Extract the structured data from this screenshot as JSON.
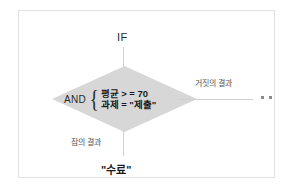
{
  "diagram": {
    "type": "if-condition-flowchart",
    "top_label": "IF",
    "decision": {
      "operator": "AND",
      "brace": "{",
      "conditions": [
        "평균 > = 70",
        "과제 = \"제출\""
      ]
    },
    "branches": {
      "false_label": "거짓의 결과",
      "true_label": "참의 결과"
    },
    "true_result": "\"수료\"",
    "false_terminal_dots": [
      "dot",
      "dot"
    ]
  },
  "colors": {
    "diamond_fill": "#d7d7d7",
    "connector_line": "#d0d0d0",
    "frame_border": "#e2e2e2",
    "text_primary": "#1a1a1a",
    "text_secondary": "#555555",
    "background": "#ffffff"
  }
}
